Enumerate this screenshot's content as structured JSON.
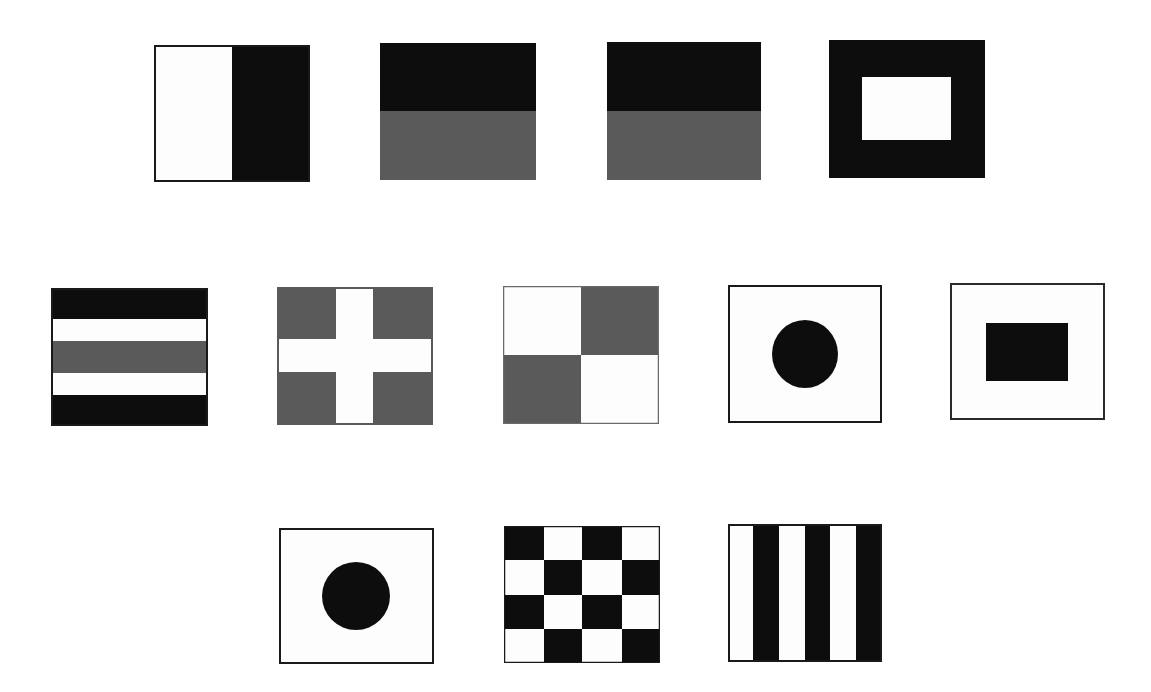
{
  "colors": {
    "white": "#fdfdfd",
    "black": "#0d0d0d",
    "gray": "#5a5a5a",
    "border": "#1a1a1a"
  },
  "flags": [
    {
      "id": "flag-1",
      "pattern": "vertical-halves-white-black",
      "x": 154,
      "y": 45,
      "w": 156,
      "h": 137
    },
    {
      "id": "flag-2",
      "pattern": "horizontal-halves-black-gray",
      "x": 380,
      "y": 43,
      "w": 156,
      "h": 137
    },
    {
      "id": "flag-3",
      "pattern": "horizontal-halves-black-gray",
      "x": 607,
      "y": 42,
      "w": 154,
      "h": 138
    },
    {
      "id": "flag-4",
      "pattern": "black-with-white-rectangle-center",
      "x": 829,
      "y": 40,
      "w": 156,
      "h": 138
    },
    {
      "id": "flag-5",
      "pattern": "horizontal-stripes-black-white-gray-white-black",
      "x": 51,
      "y": 288,
      "w": 157,
      "h": 138
    },
    {
      "id": "flag-6",
      "pattern": "gray-with-white-cross",
      "x": 277,
      "y": 287,
      "w": 156,
      "h": 138
    },
    {
      "id": "flag-7",
      "pattern": "quarters-white-gray-gray-white",
      "x": 503,
      "y": 286,
      "w": 156,
      "h": 138
    },
    {
      "id": "flag-8",
      "pattern": "white-with-black-circle",
      "x": 728,
      "y": 285,
      "w": 154,
      "h": 138
    },
    {
      "id": "flag-9",
      "pattern": "white-with-black-rectangle-center",
      "x": 950,
      "y": 283,
      "w": 155,
      "h": 137
    },
    {
      "id": "flag-10",
      "pattern": "white-with-black-circle",
      "x": 279,
      "y": 528,
      "w": 155,
      "h": 136
    },
    {
      "id": "flag-11",
      "pattern": "checkerboard-4x4-black-white",
      "x": 504,
      "y": 526,
      "w": 156,
      "h": 137
    },
    {
      "id": "flag-12",
      "pattern": "vertical-stripes-white-black-6",
      "x": 728,
      "y": 524,
      "w": 154,
      "h": 138
    }
  ]
}
